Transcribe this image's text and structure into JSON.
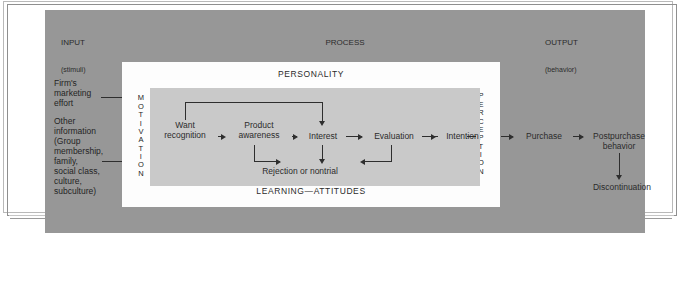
{
  "diagram": {
    "columns": {
      "input": {
        "title": "INPUT",
        "subtitle": "(stimuli)"
      },
      "process": {
        "title": "PROCESS",
        "subtitle": "Consumer decision making"
      },
      "output": {
        "title": "OUTPUT",
        "subtitle": "(behavior)"
      }
    },
    "bands": {
      "personality": "PERSONALITY",
      "learning_attitudes": "LEARNING—ATTITUDES",
      "motivation": "MOTIVATION",
      "perception": "PERCEPTION"
    },
    "input_items": [
      "Firm's\nmarketing\neffort",
      "Other\ninformation\n(Group\nmembership,\nfamily,\nsocial class,\nculture,\nsubculture)"
    ],
    "process_stages": [
      "Want\nrecognition",
      "Product\nawareness",
      "Interest",
      "Evaluation",
      "Intention"
    ],
    "process_reject": "Rejection or nontrial",
    "output_stages": [
      "Purchase",
      "Postpurchase\nbehavior",
      "Discontinuation"
    ],
    "colors": {
      "outer_box": "#979797",
      "white_panel": "#fdfdfd",
      "gray_panel": "#c9c9c9",
      "connector": "#2e2e2e",
      "text": "#242424"
    }
  }
}
